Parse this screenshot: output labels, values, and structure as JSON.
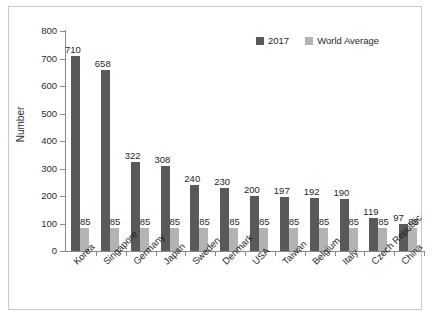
{
  "chart_data": {
    "type": "bar",
    "title": "",
    "subtitle": "",
    "xlabel": "",
    "ylabel": "Number",
    "ylim": [
      0,
      800
    ],
    "ytick_step": 100,
    "yticks": [
      800,
      700,
      600,
      500,
      400,
      300,
      200,
      100,
      0
    ],
    "grid": false,
    "legend_position": "top-right",
    "categories": [
      "Korea",
      "Singapore",
      "Germany",
      "Japan",
      "Sweden",
      "Denmark",
      "USA",
      "Taiwan",
      "Belgium",
      "Italy",
      "Czech Republic",
      "China"
    ],
    "series": [
      {
        "name": "2017",
        "color": "#595959",
        "values": [
          710,
          658,
          322,
          308,
          240,
          230,
          200,
          197,
          192,
          190,
          119,
          97
        ]
      },
      {
        "name": "World Average",
        "color": "#b3b3b3",
        "values": [
          85,
          85,
          85,
          85,
          85,
          85,
          85,
          85,
          85,
          85,
          85,
          85
        ]
      }
    ],
    "data_labels_shown": true
  },
  "frame": {
    "border_color": "#c9c9c9",
    "background": "#ffffff"
  }
}
